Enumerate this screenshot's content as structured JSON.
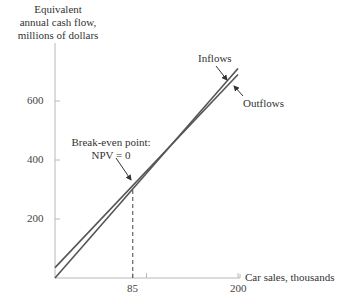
{
  "chart_data": {
    "type": "line",
    "title": "",
    "xlabel": "Car sales, thousands",
    "ylabel": "Equivalent annual cash flow, millions of dollars",
    "ylabel_lines": [
      "Equivalent",
      "annual cash flow,",
      "millions of dollars"
    ],
    "xlim": [
      0,
      200
    ],
    "ylim": [
      0,
      720
    ],
    "x_ticks": [
      85,
      100,
      200
    ],
    "x_tick_labels": [
      "85",
      "",
      "200"
    ],
    "y_ticks": [
      200,
      400,
      600
    ],
    "y_tick_labels": [
      "200",
      "400",
      "600"
    ],
    "grid": false,
    "legend": "inline annotations",
    "series": [
      {
        "name": "Inflows",
        "x": [
          0,
          200
        ],
        "values": [
          0,
          710
        ]
      },
      {
        "name": "Outflows",
        "x": [
          0,
          200
        ],
        "values": [
          35,
          690
        ]
      }
    ],
    "annotations": [
      {
        "text": "Break-even point:",
        "text2": "NPV = 0",
        "x": 85,
        "y": 310
      },
      {
        "text": "Inflows",
        "target_series": "Inflows"
      },
      {
        "text": "Outflows",
        "target_series": "Outflows"
      }
    ],
    "reference_lines": [
      {
        "type": "vertical-dashed",
        "x": 85,
        "from_y": 0,
        "to_y": 310
      }
    ]
  },
  "colors": {
    "line": "#555555",
    "axis": "#b0b0b0",
    "text": "#333333"
  }
}
